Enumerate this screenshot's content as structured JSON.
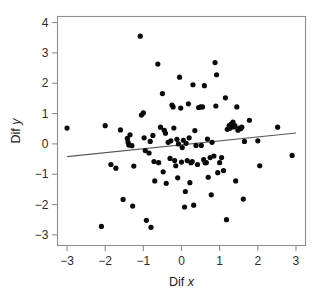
{
  "chart_data": {
    "type": "scatter",
    "title": "",
    "subtitle": "",
    "xlabel": "Dif x",
    "ylabel": "Dif y",
    "xlim": [
      -3.25,
      3.25
    ],
    "ylim": [
      -3.35,
      4.2
    ],
    "xticks": [
      -3,
      -2,
      -1,
      0,
      1,
      2,
      3
    ],
    "xtick_labels": [
      "−3",
      "−2",
      "−1",
      "0",
      "1",
      "2",
      "3"
    ],
    "yticks": [
      -3,
      -2,
      -1,
      0,
      1,
      2,
      3,
      4
    ],
    "ytick_labels": [
      "−3",
      "−2",
      "−1",
      "0",
      "1",
      "2",
      "3",
      "4"
    ],
    "grid": false,
    "legend": null,
    "point_color": "#0a0a0a",
    "point_radius": 2.6,
    "frame_color": "#8d8d8d",
    "fit_line": {
      "label": "regression line",
      "color": "#58585a",
      "x": [
        -3.0,
        3.0
      ],
      "y": [
        -0.42,
        0.36
      ]
    },
    "points": [
      [
        -3.0,
        0.52
      ],
      [
        -2.1,
        -2.72
      ],
      [
        -2.0,
        0.6
      ],
      [
        -1.85,
        -0.68
      ],
      [
        -1.72,
        -0.8
      ],
      [
        -1.6,
        0.46
      ],
      [
        -1.53,
        -1.83
      ],
      [
        -1.42,
        0.18
      ],
      [
        -1.4,
        0.05
      ],
      [
        -1.38,
        -0.04
      ],
      [
        -1.35,
        0.3
      ],
      [
        -1.3,
        -0.06
      ],
      [
        -1.28,
        -2.05
      ],
      [
        -1.25,
        -0.73
      ],
      [
        -1.08,
        3.55
      ],
      [
        -1.05,
        0.95
      ],
      [
        -1.0,
        1.02
      ],
      [
        -0.98,
        0.2
      ],
      [
        -0.95,
        -0.22
      ],
      [
        -0.92,
        -2.52
      ],
      [
        -0.85,
        -0.3
      ],
      [
        -0.82,
        0.08
      ],
      [
        -0.8,
        -2.75
      ],
      [
        -0.75,
        0.28
      ],
      [
        -0.72,
        -0.58
      ],
      [
        -0.7,
        -1.22
      ],
      [
        -0.62,
        2.63
      ],
      [
        -0.6,
        -0.62
      ],
      [
        -0.55,
        0.55
      ],
      [
        -0.5,
        1.66
      ],
      [
        -0.48,
        -0.92
      ],
      [
        -0.45,
        0.45
      ],
      [
        -0.42,
        0.35
      ],
      [
        -0.4,
        -1.3
      ],
      [
        -0.35,
        0.05
      ],
      [
        -0.3,
        -0.48
      ],
      [
        -0.28,
        0.1
      ],
      [
        -0.25,
        1.28
      ],
      [
        -0.22,
        1.22
      ],
      [
        -0.2,
        0.52
      ],
      [
        -0.18,
        -0.55
      ],
      [
        -0.15,
        -0.72
      ],
      [
        -0.12,
        0.15
      ],
      [
        -0.1,
        -1.12
      ],
      [
        -0.08,
        0.0
      ],
      [
        -0.05,
        2.2
      ],
      [
        -0.02,
        1.18
      ],
      [
        0.0,
        -0.6
      ],
      [
        0.02,
        -0.12
      ],
      [
        0.05,
        0.12
      ],
      [
        0.08,
        -2.08
      ],
      [
        0.1,
        -1.57
      ],
      [
        0.12,
        0.02
      ],
      [
        0.15,
        -0.55
      ],
      [
        0.18,
        1.32
      ],
      [
        0.2,
        0.2
      ],
      [
        0.22,
        -1.28
      ],
      [
        0.25,
        -0.62
      ],
      [
        0.28,
        -0.58
      ],
      [
        0.3,
        1.95
      ],
      [
        0.32,
        -2.02
      ],
      [
        0.35,
        0.44
      ],
      [
        0.38,
        -0.05
      ],
      [
        0.42,
        -0.68
      ],
      [
        0.45,
        1.2
      ],
      [
        0.5,
        1.22
      ],
      [
        0.52,
        -0.05
      ],
      [
        0.55,
        1.22
      ],
      [
        0.58,
        -0.52
      ],
      [
        0.6,
        1.92
      ],
      [
        0.62,
        -0.62
      ],
      [
        0.65,
        -0.62
      ],
      [
        0.68,
        0.16
      ],
      [
        0.7,
        -1.1
      ],
      [
        0.75,
        -0.45
      ],
      [
        0.78,
        -1.68
      ],
      [
        0.8,
        0.05
      ],
      [
        0.85,
        -0.4
      ],
      [
        0.88,
        2.68
      ],
      [
        0.9,
        1.25
      ],
      [
        0.92,
        2.28
      ],
      [
        0.95,
        -0.95
      ],
      [
        1.0,
        -0.62
      ],
      [
        1.05,
        -0.45
      ],
      [
        1.1,
        -0.88
      ],
      [
        1.15,
        1.52
      ],
      [
        1.18,
        -2.5
      ],
      [
        1.2,
        0.48
      ],
      [
        1.25,
        0.6
      ],
      [
        1.28,
        0.52
      ],
      [
        1.3,
        0.65
      ],
      [
        1.32,
        0.58
      ],
      [
        1.35,
        0.72
      ],
      [
        1.38,
        0.56
      ],
      [
        1.4,
        0.6
      ],
      [
        1.42,
        -1.22
      ],
      [
        1.45,
        1.22
      ],
      [
        1.48,
        0.45
      ],
      [
        1.52,
        0.52
      ],
      [
        1.55,
        0.5
      ],
      [
        1.58,
        0.55
      ],
      [
        1.62,
        -1.82
      ],
      [
        1.65,
        0.08
      ],
      [
        1.78,
        0.78
      ],
      [
        2.0,
        0.1
      ],
      [
        2.05,
        -0.72
      ],
      [
        2.52,
        0.55
      ],
      [
        2.9,
        -0.38
      ]
    ]
  },
  "figure": {
    "background": "#ffffff"
  }
}
